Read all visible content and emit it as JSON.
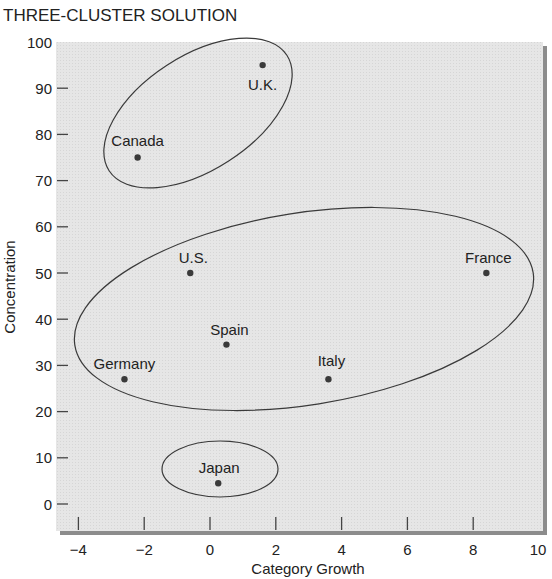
{
  "chart_data": {
    "type": "scatter",
    "title": "THREE-CLUSTER SOLUTION",
    "xlabel": "Category Growth",
    "ylabel": "Concentration",
    "xlim": [
      -4.5,
      10
    ],
    "ylim": [
      -3,
      100
    ],
    "xticks": [
      -4,
      -2,
      0,
      2,
      4,
      6,
      8,
      10
    ],
    "xtick_labels": [
      "−4",
      "−2",
      "0",
      "2",
      "4",
      "6",
      "8",
      "10"
    ],
    "yticks": [
      0,
      10,
      20,
      30,
      40,
      50,
      60,
      70,
      80,
      90,
      100
    ],
    "grid": false,
    "legend": null,
    "points": [
      {
        "label": "U.K.",
        "x": 1.6,
        "y": 95,
        "cluster": 1
      },
      {
        "label": "Canada",
        "x": -2.2,
        "y": 75,
        "cluster": 1
      },
      {
        "label": "U.S.",
        "x": -0.6,
        "y": 50,
        "cluster": 2
      },
      {
        "label": "France",
        "x": 8.4,
        "y": 50,
        "cluster": 2
      },
      {
        "label": "Spain",
        "x": 0.5,
        "y": 34.5,
        "cluster": 2
      },
      {
        "label": "Germany",
        "x": -2.6,
        "y": 27,
        "cluster": 2
      },
      {
        "label": "Italy",
        "x": 3.6,
        "y": 27,
        "cluster": 2
      },
      {
        "label": "Japan",
        "x": 0.25,
        "y": 4.5,
        "cluster": 3
      }
    ],
    "clusters": [
      {
        "id": 1,
        "members": [
          "U.K.",
          "Canada"
        ]
      },
      {
        "id": 2,
        "members": [
          "U.S.",
          "France",
          "Spain",
          "Germany",
          "Italy"
        ]
      },
      {
        "id": 3,
        "members": [
          "Japan"
        ]
      }
    ]
  },
  "colors": {
    "plot_background": "#e4e4e4",
    "frame_shadow": "#8c8c8c",
    "point": "#3a3a3a",
    "ellipse_stroke": "#3a3a3a",
    "text": "#222222"
  }
}
